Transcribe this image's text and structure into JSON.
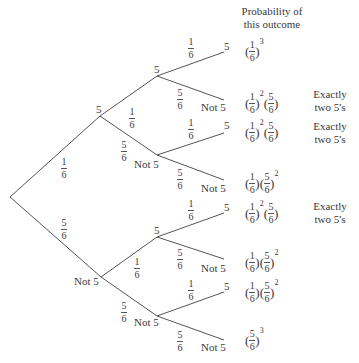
{
  "header": {
    "line1": "Probability of",
    "line2": "this outcome"
  },
  "colors": {
    "line": "#555555",
    "text": "#3a3a3a",
    "background": "#ffffff"
  },
  "nodes": {
    "l1_five": "5",
    "l1_not5": "Not 5",
    "l2_a": "5",
    "l2_b": "Not 5",
    "l2_c": "5",
    "l2_d": "Not 5"
  },
  "leaves": [
    {
      "label": "5"
    },
    {
      "label": "Not 5"
    },
    {
      "label": "5"
    },
    {
      "label": "Not 5"
    },
    {
      "label": "5"
    },
    {
      "label": "Not 5"
    },
    {
      "label": "5"
    },
    {
      "label": "Not 5"
    }
  ],
  "branch_probs": {
    "root_five": {
      "num": "1",
      "den": "6"
    },
    "root_not5": {
      "num": "5",
      "den": "6"
    },
    "l1a_five": {
      "num": "1",
      "den": "6"
    },
    "l1a_not5": {
      "num": "5",
      "den": "6"
    },
    "l1b_five": {
      "num": "1",
      "den": "6"
    },
    "l1b_not5": {
      "num": "5",
      "den": "6"
    },
    "leaf": [
      {
        "num": "1",
        "den": "6"
      },
      {
        "num": "5",
        "den": "6"
      },
      {
        "num": "1",
        "den": "6"
      },
      {
        "num": "5",
        "den": "6"
      },
      {
        "num": "1",
        "den": "6"
      },
      {
        "num": "5",
        "den": "6"
      },
      {
        "num": "1",
        "den": "6"
      },
      {
        "num": "5",
        "den": "6"
      }
    ]
  },
  "outcomes": [
    {
      "factors": [
        {
          "num": "1",
          "den": "6",
          "exp": "3"
        }
      ],
      "note": ""
    },
    {
      "factors": [
        {
          "num": "1",
          "den": "6",
          "exp": "2"
        },
        {
          "num": "5",
          "den": "6",
          "exp": ""
        }
      ],
      "note": "Exactly two 5's"
    },
    {
      "factors": [
        {
          "num": "1",
          "den": "6",
          "exp": "2"
        },
        {
          "num": "5",
          "den": "6",
          "exp": ""
        }
      ],
      "note": "Exactly two 5's"
    },
    {
      "factors": [
        {
          "num": "1",
          "den": "6",
          "exp": ""
        },
        {
          "num": "5",
          "den": "6",
          "exp": "2"
        }
      ],
      "note": ""
    },
    {
      "factors": [
        {
          "num": "1",
          "den": "6",
          "exp": "2"
        },
        {
          "num": "5",
          "den": "6",
          "exp": ""
        }
      ],
      "note": "Exactly two 5's"
    },
    {
      "factors": [
        {
          "num": "1",
          "den": "6",
          "exp": ""
        },
        {
          "num": "5",
          "den": "6",
          "exp": "2"
        }
      ],
      "note": ""
    },
    {
      "factors": [
        {
          "num": "1",
          "den": "6",
          "exp": ""
        },
        {
          "num": "5",
          "den": "6",
          "exp": "2"
        }
      ],
      "note": ""
    },
    {
      "factors": [
        {
          "num": "5",
          "den": "6",
          "exp": "3"
        }
      ],
      "note": ""
    }
  ],
  "notes": {
    "line1": "Exactly",
    "line2": "two 5's"
  }
}
